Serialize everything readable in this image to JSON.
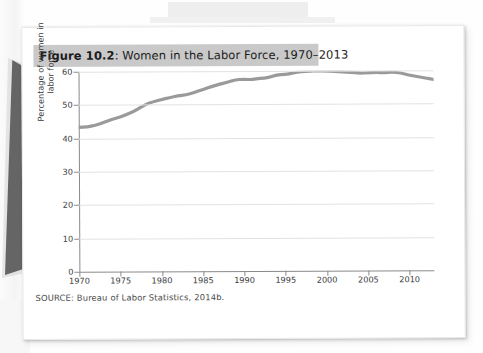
{
  "figure": {
    "number_label": "Figure 10.2",
    "title_separator": ": ",
    "title": "Women in the Labor Force, 1970–2013",
    "source": "SOURCE: Bureau of Labor Statistics, 2014b.",
    "title_band_color": "#c9c9c9",
    "page_color": "#ffffff"
  },
  "chart_data": {
    "type": "line",
    "title": "Women in the Labor Force, 1970–2013",
    "xlabel": "",
    "ylabel": "Percentage of women in labor force",
    "ylabel_lines": [
      "Percentage of women in",
      "labor force"
    ],
    "xlim": [
      1970,
      2013
    ],
    "ylim": [
      0,
      60
    ],
    "yticks": [
      0,
      10,
      20,
      30,
      40,
      50,
      60
    ],
    "ytick_labels": [
      "0",
      "10",
      "20",
      "30",
      "40",
      "50",
      "60"
    ],
    "xticks": [
      1970,
      1975,
      1980,
      1985,
      1990,
      1995,
      2000,
      2005,
      2010
    ],
    "xtick_labels": [
      "1970",
      "1975",
      "1980",
      "1985",
      "1990",
      "1995",
      "2000",
      "2005",
      "2010"
    ],
    "grid": true,
    "grid_color": "#e2e2e2",
    "legend": null,
    "line_color": "#9a9a9a",
    "line_width": 3.2,
    "series": [
      {
        "name": "Percentage of women in labor force",
        "x": [
          1970,
          1971,
          1972,
          1973,
          1974,
          1975,
          1976,
          1977,
          1978,
          1979,
          1980,
          1981,
          1982,
          1983,
          1984,
          1985,
          1986,
          1987,
          1988,
          1989,
          1990,
          1991,
          1992,
          1993,
          1994,
          1995,
          1996,
          1997,
          1998,
          1999,
          2000,
          2001,
          2002,
          2003,
          2004,
          2005,
          2006,
          2007,
          2008,
          2009,
          2010,
          2011,
          2012,
          2013
        ],
        "values": [
          43.3,
          43.4,
          43.9,
          44.7,
          45.7,
          46.3,
          47.3,
          48.4,
          50.0,
          50.9,
          51.5,
          52.1,
          52.6,
          52.9,
          53.6,
          54.5,
          55.3,
          56.0,
          56.6,
          57.4,
          57.5,
          57.4,
          57.8,
          57.9,
          58.8,
          58.9,
          59.3,
          59.8,
          59.8,
          60.0,
          59.9,
          59.8,
          59.6,
          59.5,
          59.2,
          59.3,
          59.4,
          59.3,
          59.5,
          59.2,
          58.6,
          58.1,
          57.7,
          57.2
        ]
      }
    ]
  }
}
